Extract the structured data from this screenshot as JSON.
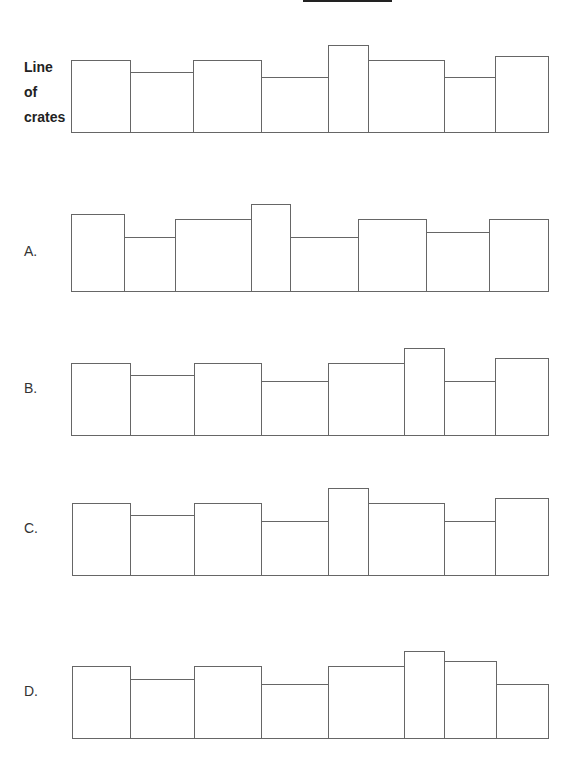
{
  "title_blank": "",
  "stem": {
    "label_lines": [
      "Line",
      "of",
      "crates"
    ],
    "bottom": 133,
    "crates": [
      {
        "x1": 71,
        "x2": 130,
        "top": 60
      },
      {
        "x1": 130,
        "x2": 193,
        "top": 72
      },
      {
        "x1": 193,
        "x2": 261,
        "top": 60
      },
      {
        "x1": 261,
        "x2": 328,
        "top": 77
      },
      {
        "x1": 328,
        "x2": 368,
        "top": 45
      },
      {
        "x1": 368,
        "x2": 444,
        "top": 60
      },
      {
        "x1": 444,
        "x2": 495,
        "top": 77
      },
      {
        "x1": 495,
        "x2": 548,
        "top": 56
      }
    ]
  },
  "options": [
    {
      "label": "A.",
      "label_y": 243,
      "bottom": 292,
      "crates": [
        {
          "x1": 71,
          "x2": 124,
          "top": 214
        },
        {
          "x1": 124,
          "x2": 175,
          "top": 237
        },
        {
          "x1": 175,
          "x2": 251,
          "top": 219
        },
        {
          "x1": 251,
          "x2": 290,
          "top": 204
        },
        {
          "x1": 290,
          "x2": 358,
          "top": 237
        },
        {
          "x1": 358,
          "x2": 426,
          "top": 219
        },
        {
          "x1": 426,
          "x2": 489,
          "top": 232
        },
        {
          "x1": 489,
          "x2": 548,
          "top": 219
        }
      ]
    },
    {
      "label": "B.",
      "label_y": 380,
      "bottom": 436,
      "crates": [
        {
          "x1": 71,
          "x2": 130,
          "top": 363
        },
        {
          "x1": 130,
          "x2": 194,
          "top": 375
        },
        {
          "x1": 194,
          "x2": 261,
          "top": 363
        },
        {
          "x1": 261,
          "x2": 328,
          "top": 381
        },
        {
          "x1": 328,
          "x2": 404,
          "top": 363
        },
        {
          "x1": 404,
          "x2": 444,
          "top": 348
        },
        {
          "x1": 444,
          "x2": 495,
          "top": 381
        },
        {
          "x1": 495,
          "x2": 548,
          "top": 358
        }
      ]
    },
    {
      "label": "C.",
      "label_y": 520,
      "bottom": 576,
      "crates": [
        {
          "x1": 72,
          "x2": 130,
          "top": 503
        },
        {
          "x1": 130,
          "x2": 194,
          "top": 515
        },
        {
          "x1": 194,
          "x2": 261,
          "top": 503
        },
        {
          "x1": 261,
          "x2": 328,
          "top": 521
        },
        {
          "x1": 328,
          "x2": 368,
          "top": 488
        },
        {
          "x1": 368,
          "x2": 444,
          "top": 503
        },
        {
          "x1": 444,
          "x2": 495,
          "top": 521
        },
        {
          "x1": 495,
          "x2": 548,
          "top": 498
        }
      ]
    },
    {
      "label": "D.",
      "label_y": 683,
      "bottom": 739,
      "crates": [
        {
          "x1": 72,
          "x2": 130,
          "top": 666
        },
        {
          "x1": 130,
          "x2": 194,
          "top": 679
        },
        {
          "x1": 194,
          "x2": 261,
          "top": 666
        },
        {
          "x1": 261,
          "x2": 328,
          "top": 684
        },
        {
          "x1": 328,
          "x2": 404,
          "top": 666
        },
        {
          "x1": 404,
          "x2": 444,
          "top": 651
        },
        {
          "x1": 444,
          "x2": 496,
          "top": 661
        },
        {
          "x1": 496,
          "x2": 548,
          "top": 684
        }
      ]
    }
  ]
}
